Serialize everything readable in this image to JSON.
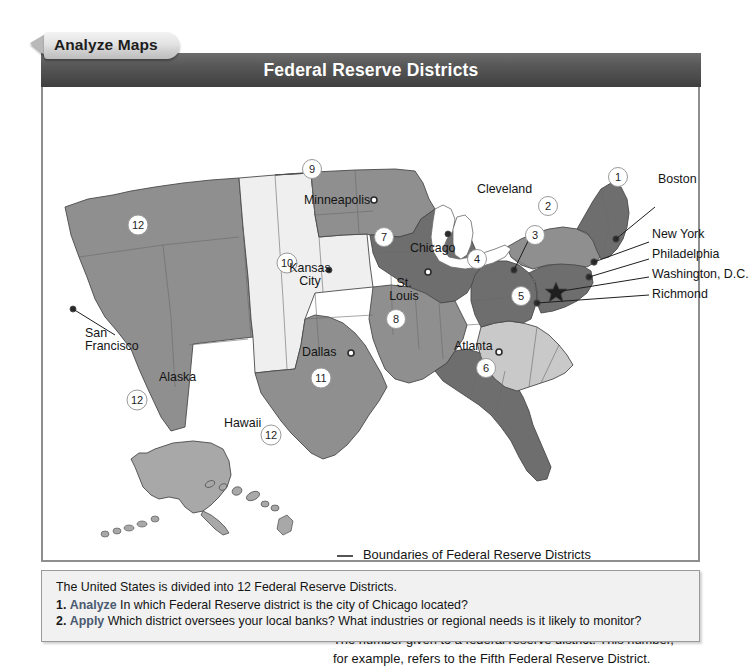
{
  "tab": {
    "label": "Analyze Maps"
  },
  "header": {
    "title": "Federal Reserve Districts"
  },
  "map": {
    "city_labels": [
      {
        "name": "San Francisco",
        "line1": "San",
        "line2": "Francisco"
      },
      {
        "name": "Minneapolis",
        "text": "Minneapolis"
      },
      {
        "name": "Kansas City",
        "line1": "Kansas",
        "line2": "City"
      },
      {
        "name": "Chicago",
        "text": "Chicago"
      },
      {
        "name": "St. Louis",
        "line1": "St.",
        "line2": "Louis"
      },
      {
        "name": "Dallas",
        "text": "Dallas"
      },
      {
        "name": "Atlanta",
        "text": "Atlanta"
      },
      {
        "name": "Cleveland",
        "text": "Cleveland"
      },
      {
        "name": "Boston",
        "text": "Boston"
      },
      {
        "name": "New York",
        "text": "New York"
      },
      {
        "name": "Philadelphia",
        "text": "Philadelphia"
      },
      {
        "name": "Washington, D.C.",
        "text": "Washington, D.C."
      },
      {
        "name": "Richmond",
        "text": "Richmond"
      }
    ],
    "inset_labels": [
      {
        "name": "Alaska",
        "text": "Alaska"
      },
      {
        "name": "Hawaii",
        "text": "Hawaii"
      }
    ],
    "district_numbers": [
      "1",
      "2",
      "3",
      "4",
      "5",
      "6",
      "7",
      "8",
      "9",
      "10",
      "11",
      "12",
      "12",
      "12"
    ],
    "colors": {
      "district_dark": "#6e6e6e",
      "district_mid": "#8f8f8f",
      "district_light": "#c9c9c9",
      "district_pale": "#efefef",
      "border": "#4a4a4a",
      "title_bar": "#4f4f4f",
      "panel_border": "#8e8e8e"
    }
  },
  "legend": {
    "items": [
      {
        "marker": "line-icon",
        "text": "Boundaries of Federal Reserve Districts"
      },
      {
        "marker": "dot-icon",
        "text": "Federal Reserve Bank Cities"
      },
      {
        "marker": "star-icon",
        "text": "Board of Governors of the Federal Reserve System"
      },
      {
        "marker": "circled-number-icon",
        "marker_value": "5",
        "text_line1": "The number given to a federal reserve district. This number,",
        "text_line2": "for example, refers to the Fifth Federal Reserve District."
      }
    ]
  },
  "questions": {
    "intro": "The United States is divided into 12 Federal Reserve Districts.",
    "items": [
      {
        "num": "1.",
        "verb": "Analyze",
        "text": "In which Federal Reserve district is the city of Chicago located?"
      },
      {
        "num": "2.",
        "verb": "Apply",
        "text": "Which district oversees your local banks? What industries or regional needs is it likely to monitor?"
      }
    ]
  }
}
